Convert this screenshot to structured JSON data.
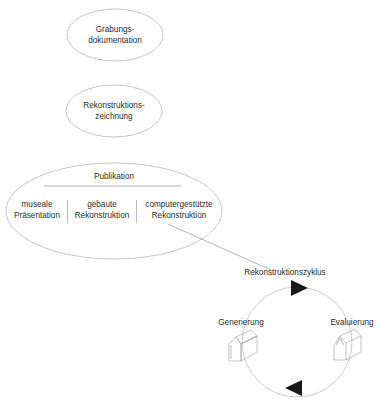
{
  "diagram": {
    "top_cut_text": "",
    "nodes": [
      {
        "id": "grabung",
        "line1": "Grabungs-",
        "line2": "dokumentation"
      },
      {
        "id": "rekzeichnung",
        "line1": "Rekonstruktions-",
        "line2": "zeichnung"
      }
    ],
    "publikation": {
      "title": "Publikation",
      "columns": [
        {
          "line1": "museale",
          "line2": "Präsentation"
        },
        {
          "line1": "gebaute",
          "line2": "Rekonstruktion"
        },
        {
          "line1": "computergestützte",
          "line2": "Rekonstruktion"
        }
      ]
    },
    "cycle": {
      "title": "Rekonstruktionszyklus",
      "left_label": "Generierung",
      "right_label": "Evaluierung",
      "top_arrow": "arrow-right",
      "bottom_arrow": "arrow-left"
    },
    "colors": {
      "stroke": "#b8b8b8",
      "text": "#2b2b2b",
      "arrow": "#1a1a1a"
    }
  }
}
